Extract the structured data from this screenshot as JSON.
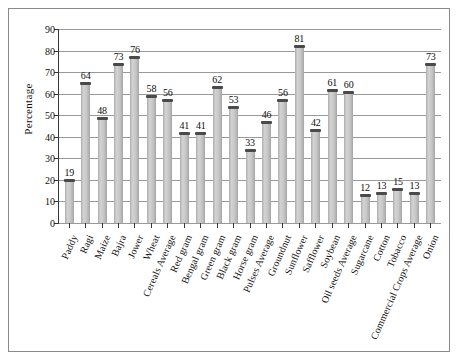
{
  "chart_data": {
    "type": "bar",
    "title": "",
    "xlabel": "",
    "ylabel": "Percentage",
    "ylim": [
      0,
      90
    ],
    "ytick_step": 10,
    "yticks": [
      0,
      10,
      20,
      30,
      40,
      50,
      60,
      70,
      80,
      90
    ],
    "grid": true,
    "legend": "none",
    "bar_color": "#c9c9c9",
    "bar_edge_color": "#4a4a4a",
    "axis_color": "#3a3a3a",
    "categories": [
      "Paddy",
      "Ragi",
      "Maize",
      "Bajra",
      "Jower",
      "Wheat",
      "Cereals Average",
      "Red gram",
      "Bengal gram",
      "Green gram",
      "Black gram",
      "Horse gram",
      "Pulses Average",
      "Groundnut",
      "Sunflower",
      "Safflower",
      "Soybean",
      "Oil seeds Average",
      "Sugarcane",
      "Cotton",
      "Tobacco",
      "Commercial Crops Average",
      "Onion"
    ],
    "values": [
      19,
      64,
      48,
      73,
      76,
      58,
      56,
      41,
      41,
      62,
      53,
      33,
      46,
      56,
      81,
      42,
      61,
      60,
      12,
      13,
      15,
      13,
      73
    ]
  }
}
